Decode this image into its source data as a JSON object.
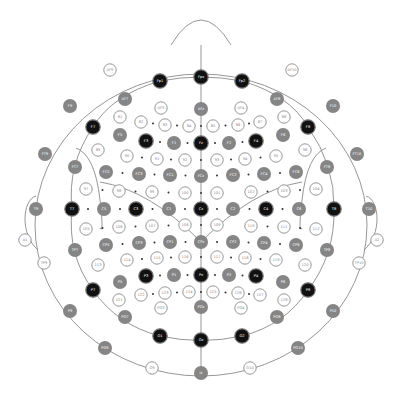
{
  "colors": {
    "outline": "#8a8a8a",
    "primary_fill": "#111111",
    "primary_text": "#ffffff",
    "secondary_fill": "#858585",
    "secondary_text": "#ffffff",
    "numbered_stroke": "#8a8a8a",
    "numbered_fill": "#ffffff",
    "numbered_text": "#888888",
    "dot": "#333333"
  },
  "electrodes": [
    {
      "label": "Fpz",
      "x": 201,
      "y": 77,
      "type": "primary"
    },
    {
      "label": "Fp1",
      "x": 160,
      "y": 81,
      "type": "primary"
    },
    {
      "label": "Fp2",
      "x": 242,
      "y": 81,
      "type": "primary"
    },
    {
      "label": "AF9",
      "x": 110,
      "y": 70,
      "type": "outer"
    },
    {
      "label": "AF10",
      "x": 292,
      "y": 70,
      "type": "outer"
    },
    {
      "label": "AF7",
      "x": 125,
      "y": 99,
      "type": "secondary"
    },
    {
      "label": "AF8",
      "x": 277,
      "y": 99,
      "type": "secondary"
    },
    {
      "label": "AF3",
      "x": 161,
      "y": 108,
      "type": "numbered"
    },
    {
      "label": "AF4",
      "x": 241,
      "y": 108,
      "type": "numbered"
    },
    {
      "label": "AFz",
      "x": 201,
      "y": 109,
      "type": "secondary"
    },
    {
      "label": "F9",
      "x": 70,
      "y": 106,
      "type": "secondary"
    },
    {
      "label": "F10",
      "x": 333,
      "y": 106,
      "type": "secondary"
    },
    {
      "label": "81",
      "x": 120,
      "y": 117,
      "type": "numbered"
    },
    {
      "label": "82",
      "x": 141,
      "y": 122,
      "type": "numbered"
    },
    {
      "label": "83",
      "x": 165,
      "y": 125,
      "type": "numbered"
    },
    {
      "label": "84",
      "x": 189,
      "y": 126,
      "type": "numbered"
    },
    {
      "label": "85",
      "x": 213,
      "y": 126,
      "type": "numbered"
    },
    {
      "label": "86",
      "x": 238,
      "y": 125,
      "type": "numbered"
    },
    {
      "label": "87",
      "x": 260,
      "y": 122,
      "type": "numbered"
    },
    {
      "label": "88",
      "x": 284,
      "y": 117,
      "type": "numbered"
    },
    {
      "label": "F7",
      "x": 93,
      "y": 127,
      "type": "primary"
    },
    {
      "label": "F8",
      "x": 308,
      "y": 127,
      "type": "primary"
    },
    {
      "label": "F5",
      "x": 120,
      "y": 135,
      "type": "secondary"
    },
    {
      "label": "F3",
      "x": 146,
      "y": 141,
      "type": "primary"
    },
    {
      "label": "F1",
      "x": 174,
      "y": 143,
      "type": "secondary"
    },
    {
      "label": "Fz",
      "x": 201,
      "y": 143,
      "type": "primary"
    },
    {
      "label": "F2",
      "x": 229,
      "y": 143,
      "type": "secondary"
    },
    {
      "label": "F4",
      "x": 256,
      "y": 141,
      "type": "primary"
    },
    {
      "label": "F6",
      "x": 283,
      "y": 135,
      "type": "secondary"
    },
    {
      "label": "FT9",
      "x": 45,
      "y": 154,
      "type": "secondary"
    },
    {
      "label": "FT10",
      "x": 357,
      "y": 154,
      "type": "secondary"
    },
    {
      "label": "89",
      "x": 98,
      "y": 150,
      "type": "numbered"
    },
    {
      "label": "90",
      "x": 127,
      "y": 156,
      "type": "numbered"
    },
    {
      "label": "91",
      "x": 157,
      "y": 159,
      "type": "numbered"
    },
    {
      "label": "92",
      "x": 185,
      "y": 160,
      "type": "numbered"
    },
    {
      "label": "93",
      "x": 217,
      "y": 160,
      "type": "numbered"
    },
    {
      "label": "94",
      "x": 245,
      "y": 159,
      "type": "numbered"
    },
    {
      "label": "95",
      "x": 276,
      "y": 156,
      "type": "numbered"
    },
    {
      "label": "96",
      "x": 305,
      "y": 150,
      "type": "numbered"
    },
    {
      "label": "FT7",
      "x": 75,
      "y": 167,
      "type": "secondary"
    },
    {
      "label": "FT8",
      "x": 327,
      "y": 167,
      "type": "secondary"
    },
    {
      "label": "FC5",
      "x": 106,
      "y": 172,
      "type": "secondary"
    },
    {
      "label": "FC3",
      "x": 139,
      "y": 174,
      "type": "secondary"
    },
    {
      "label": "FC1",
      "x": 170,
      "y": 175,
      "type": "secondary"
    },
    {
      "label": "FCz",
      "x": 201,
      "y": 176,
      "type": "secondary"
    },
    {
      "label": "FC2",
      "x": 233,
      "y": 175,
      "type": "secondary"
    },
    {
      "label": "FC4",
      "x": 264,
      "y": 174,
      "type": "secondary"
    },
    {
      "label": "FC6",
      "x": 296,
      "y": 172,
      "type": "secondary"
    },
    {
      "label": "97",
      "x": 86,
      "y": 189,
      "type": "numbered"
    },
    {
      "label": "98",
      "x": 119,
      "y": 191,
      "type": "numbered"
    },
    {
      "label": "99",
      "x": 152,
      "y": 192,
      "type": "numbered"
    },
    {
      "label": "100",
      "x": 185,
      "y": 193,
      "type": "numbered"
    },
    {
      "label": "101",
      "x": 217,
      "y": 193,
      "type": "numbered"
    },
    {
      "label": "102",
      "x": 251,
      "y": 192,
      "type": "numbered"
    },
    {
      "label": "103",
      "x": 284,
      "y": 191,
      "type": "numbered"
    },
    {
      "label": "104",
      "x": 316,
      "y": 189,
      "type": "numbered"
    },
    {
      "label": "T9",
      "x": 36,
      "y": 209,
      "type": "secondary"
    },
    {
      "label": "T7",
      "x": 72,
      "y": 209,
      "type": "primary"
    },
    {
      "label": "C5",
      "x": 104,
      "y": 209,
      "type": "secondary"
    },
    {
      "label": "C3",
      "x": 136,
      "y": 209,
      "type": "primary"
    },
    {
      "label": "C1",
      "x": 169,
      "y": 209,
      "type": "secondary"
    },
    {
      "label": "Cz",
      "x": 201,
      "y": 209,
      "type": "primary"
    },
    {
      "label": "C2",
      "x": 233,
      "y": 209,
      "type": "secondary"
    },
    {
      "label": "C4",
      "x": 266,
      "y": 209,
      "type": "primary"
    },
    {
      "label": "C6",
      "x": 299,
      "y": 209,
      "type": "secondary"
    },
    {
      "label": "T8",
      "x": 334,
      "y": 209,
      "type": "primary"
    },
    {
      "label": "T10",
      "x": 369,
      "y": 209,
      "type": "secondary"
    },
    {
      "label": "105",
      "x": 86,
      "y": 229,
      "type": "numbered"
    },
    {
      "label": "106",
      "x": 119,
      "y": 227,
      "type": "numbered"
    },
    {
      "label": "107",
      "x": 152,
      "y": 226,
      "type": "numbered"
    },
    {
      "label": "108",
      "x": 185,
      "y": 225,
      "type": "numbered"
    },
    {
      "label": "109",
      "x": 217,
      "y": 225,
      "type": "numbered"
    },
    {
      "label": "110",
      "x": 251,
      "y": 226,
      "type": "numbered"
    },
    {
      "label": "111",
      "x": 284,
      "y": 227,
      "type": "numbered"
    },
    {
      "label": "112",
      "x": 316,
      "y": 229,
      "type": "numbered"
    },
    {
      "label": "A1",
      "x": 25,
      "y": 240,
      "type": "outer"
    },
    {
      "label": "A2",
      "x": 377,
      "y": 240,
      "type": "outer"
    },
    {
      "label": "TP7",
      "x": 75,
      "y": 250,
      "type": "secondary"
    },
    {
      "label": "CP5",
      "x": 106,
      "y": 245,
      "type": "secondary"
    },
    {
      "label": "CP3",
      "x": 139,
      "y": 243,
      "type": "secondary"
    },
    {
      "label": "CP1",
      "x": 170,
      "y": 242,
      "type": "secondary"
    },
    {
      "label": "CPz",
      "x": 201,
      "y": 242,
      "type": "secondary"
    },
    {
      "label": "CP2",
      "x": 233,
      "y": 242,
      "type": "secondary"
    },
    {
      "label": "CP4",
      "x": 264,
      "y": 243,
      "type": "secondary"
    },
    {
      "label": "CP6",
      "x": 296,
      "y": 245,
      "type": "secondary"
    },
    {
      "label": "TP8",
      "x": 327,
      "y": 250,
      "type": "secondary"
    },
    {
      "label": "TP9",
      "x": 44,
      "y": 263,
      "type": "outer"
    },
    {
      "label": "TP10",
      "x": 359,
      "y": 263,
      "type": "outer"
    },
    {
      "label": "113",
      "x": 98,
      "y": 265,
      "type": "numbered"
    },
    {
      "label": "114",
      "x": 127,
      "y": 260,
      "type": "numbered"
    },
    {
      "label": "115",
      "x": 157,
      "y": 258,
      "type": "numbered"
    },
    {
      "label": "116",
      "x": 185,
      "y": 257,
      "type": "numbered"
    },
    {
      "label": "117",
      "x": 217,
      "y": 257,
      "type": "numbered"
    },
    {
      "label": "118",
      "x": 245,
      "y": 258,
      "type": "numbered"
    },
    {
      "label": "119",
      "x": 276,
      "y": 260,
      "type": "numbered"
    },
    {
      "label": "120",
      "x": 305,
      "y": 265,
      "type": "numbered"
    },
    {
      "label": "P5",
      "x": 120,
      "y": 282,
      "type": "secondary"
    },
    {
      "label": "P3",
      "x": 146,
      "y": 276,
      "type": "primary"
    },
    {
      "label": "P1",
      "x": 174,
      "y": 275,
      "type": "secondary"
    },
    {
      "label": "Pz",
      "x": 201,
      "y": 275,
      "type": "primary"
    },
    {
      "label": "P2",
      "x": 229,
      "y": 275,
      "type": "secondary"
    },
    {
      "label": "P4",
      "x": 256,
      "y": 276,
      "type": "primary"
    },
    {
      "label": "P6",
      "x": 283,
      "y": 282,
      "type": "secondary"
    },
    {
      "label": "P7",
      "x": 93,
      "y": 290,
      "type": "primary"
    },
    {
      "label": "P8",
      "x": 308,
      "y": 290,
      "type": "primary"
    },
    {
      "label": "121",
      "x": 119,
      "y": 300,
      "type": "numbered"
    },
    {
      "label": "122",
      "x": 141,
      "y": 295,
      "type": "numbered"
    },
    {
      "label": "123",
      "x": 165,
      "y": 293,
      "type": "numbered"
    },
    {
      "label": "124",
      "x": 189,
      "y": 292,
      "type": "numbered"
    },
    {
      "label": "125",
      "x": 213,
      "y": 292,
      "type": "numbered"
    },
    {
      "label": "126",
      "x": 238,
      "y": 293,
      "type": "numbered"
    },
    {
      "label": "127",
      "x": 260,
      "y": 295,
      "type": "numbered"
    },
    {
      "label": "128",
      "x": 284,
      "y": 300,
      "type": "numbered"
    },
    {
      "label": "P9",
      "x": 70,
      "y": 311,
      "type": "secondary"
    },
    {
      "label": "P10",
      "x": 333,
      "y": 311,
      "type": "secondary"
    },
    {
      "label": "PO3",
      "x": 161,
      "y": 308,
      "type": "numbered"
    },
    {
      "label": "POz",
      "x": 201,
      "y": 307,
      "type": "secondary"
    },
    {
      "label": "PO4",
      "x": 241,
      "y": 308,
      "type": "numbered"
    },
    {
      "label": "PO7",
      "x": 125,
      "y": 317,
      "type": "secondary"
    },
    {
      "label": "PO8",
      "x": 277,
      "y": 317,
      "type": "secondary"
    },
    {
      "label": "O1",
      "x": 160,
      "y": 336,
      "type": "primary"
    },
    {
      "label": "Oz",
      "x": 201,
      "y": 340,
      "type": "primary"
    },
    {
      "label": "O2",
      "x": 242,
      "y": 336,
      "type": "primary"
    },
    {
      "label": "PO9",
      "x": 105,
      "y": 348,
      "type": "secondary"
    },
    {
      "label": "PO10",
      "x": 298,
      "y": 348,
      "type": "secondary"
    },
    {
      "label": "O9",
      "x": 152,
      "y": 368,
      "type": "outer"
    },
    {
      "label": "O10",
      "x": 250,
      "y": 368,
      "type": "outer"
    },
    {
      "label": "Iz",
      "x": 201,
      "y": 373,
      "type": "secondary"
    }
  ]
}
